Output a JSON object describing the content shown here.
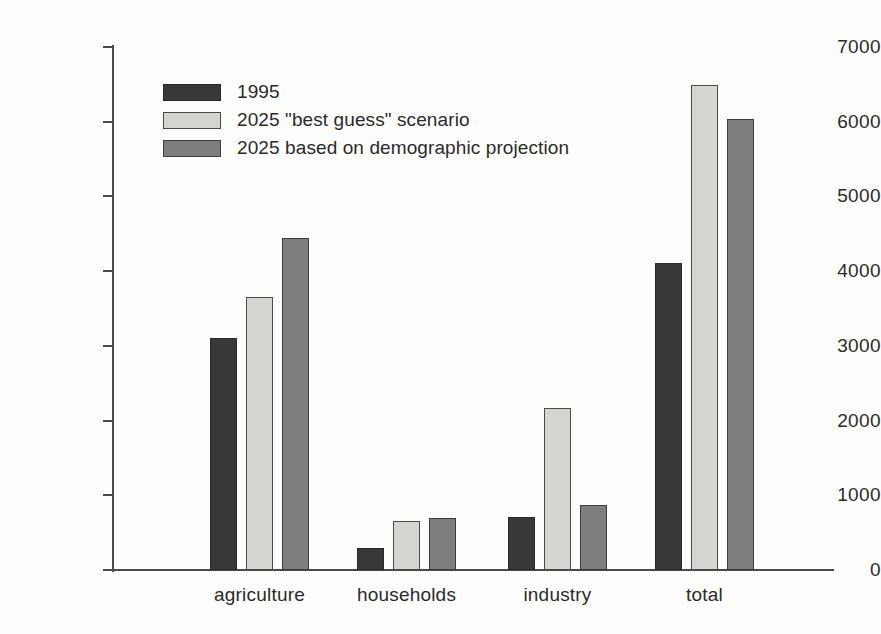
{
  "chart_data": {
    "type": "bar",
    "title": "",
    "subtitle": "",
    "xlabel": "",
    "ylabel": "",
    "ylim": [
      0,
      7000
    ],
    "ytick_labels": [
      "0",
      "1000",
      "2000",
      "3000",
      "4000",
      "5000",
      "6000",
      "7000"
    ],
    "ytick_values": [
      0,
      1000,
      2000,
      3000,
      4000,
      5000,
      6000,
      7000
    ],
    "grid": false,
    "legend_position": "upper-left-inside",
    "categories": [
      "agriculture",
      "households",
      "industry",
      "total"
    ],
    "series": [
      {
        "name": "1995",
        "color": "#383838",
        "values": [
          3100,
          300,
          710,
          4110
        ]
      },
      {
        "name": "2025 \"best guess\" scenario",
        "color": "#d5d5d2",
        "values": [
          3650,
          650,
          2170,
          6490
        ]
      },
      {
        "name": "2025 based on demographic projection",
        "color": "#7e7e7e",
        "values": [
          4450,
          700,
          870,
          6040
        ]
      }
    ]
  },
  "legend": {
    "items": [
      {
        "label": "1995",
        "swatch": "legend-swatch-1995"
      },
      {
        "label": "2025 \"best guess\" scenario",
        "swatch": "legend-swatch-best-guess"
      },
      {
        "label": "2025 based on demographic projection",
        "swatch": "legend-swatch-demographic"
      }
    ]
  },
  "axis": {
    "y_ticks": [
      "0",
      "1000",
      "2000",
      "3000",
      "4000",
      "5000",
      "6000",
      "7000"
    ],
    "x_categories": [
      "agriculture",
      "households",
      "industry",
      "total"
    ]
  }
}
